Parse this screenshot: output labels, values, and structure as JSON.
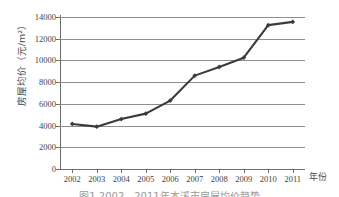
{
  "chart_data": {
    "type": "line",
    "title": "",
    "xlabel": "年份",
    "ylabel": "房屋均价（元/m²）",
    "categories": [
      "2002",
      "2003",
      "2004",
      "2005",
      "2006",
      "2007",
      "2008",
      "2009",
      "2010",
      "2011"
    ],
    "values": [
      4150,
      3900,
      4600,
      5100,
      6300,
      8600,
      9400,
      10250,
      13250,
      13550
    ],
    "series": [
      {
        "name": "房屋均价",
        "values": [
          4150,
          3900,
          4600,
          5100,
          6300,
          8600,
          9400,
          10250,
          13250,
          13550
        ]
      }
    ],
    "ylim": [
      0,
      14000
    ],
    "yticks": [
      0,
      2000,
      4000,
      6000,
      8000,
      10000,
      12000,
      14000
    ],
    "ytick_labels": [
      "0",
      "2000",
      "4000",
      "6000",
      "8000",
      "10000",
      "12000",
      "14000"
    ],
    "grid": true,
    "legend": false,
    "marker": "diamond",
    "line_color": "#3b3b3b",
    "grid_color": "#8e8e8e",
    "axis_color": "#6d6d6d"
  },
  "caption": "图1  2002—2011年本溪市房屋均价趋势"
}
